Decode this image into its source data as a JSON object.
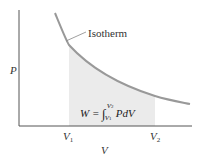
{
  "diagram": {
    "title": "",
    "axes": {
      "y_label": "P",
      "x_label": "V",
      "x_ticks": [
        {
          "base": "V",
          "sub": "1"
        },
        {
          "base": "V",
          "sub": "2"
        }
      ]
    },
    "curve": {
      "label": "Isotherm",
      "color": "#999999"
    },
    "shaded_region": {
      "color": "#ebebeb",
      "formula": {
        "lhs": "W =",
        "integral": "∫",
        "upper": "V",
        "upper_sub": "2",
        "lower": "V",
        "lower_sub": "1",
        "integrand": "PdV"
      }
    },
    "colors": {
      "axis": "#555555",
      "text": "#333333"
    }
  }
}
